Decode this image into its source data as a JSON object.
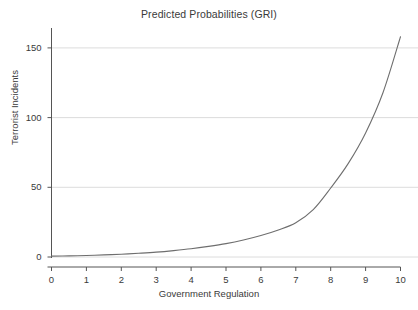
{
  "chart_data": {
    "type": "line",
    "title": "Predicted Probabilities (GRI)",
    "xlabel": "Government Regulation",
    "ylabel": "Terrorist Incidents",
    "xlim": [
      0,
      10
    ],
    "ylim": [
      0,
      160
    ],
    "grid": true,
    "grid_axis": "y",
    "legend": "none",
    "x_ticks": [
      0,
      1,
      2,
      3,
      4,
      5,
      6,
      7,
      8,
      9,
      10
    ],
    "x_tick_labels": [
      "0",
      "1",
      "2",
      "3",
      "4",
      "5",
      "6",
      "7",
      "8",
      "9",
      "10"
    ],
    "y_ticks": [
      0,
      50,
      100,
      150
    ],
    "y_tick_labels": [
      "0",
      "50",
      "100",
      "150"
    ],
    "line_color": "#6e6e6e",
    "grid_color": "#d8d8d8",
    "axis_color": "#555555",
    "series": [
      {
        "name": "Predicted Incidents",
        "x": [
          0,
          0.5,
          1,
          1.5,
          2,
          2.5,
          3,
          3.5,
          4,
          4.5,
          5,
          5.5,
          6,
          6.5,
          7,
          7.5,
          8,
          8.5,
          9,
          9.5,
          10
        ],
        "values": [
          0.6,
          0.8,
          1.1,
          1.5,
          2.0,
          2.7,
          3.5,
          4.6,
          5.9,
          7.6,
          9.6,
          12.2,
          15.4,
          19.4,
          24.6,
          34.0,
          49.5,
          67.0,
          89.0,
          118.0,
          158.0
        ]
      }
    ]
  }
}
